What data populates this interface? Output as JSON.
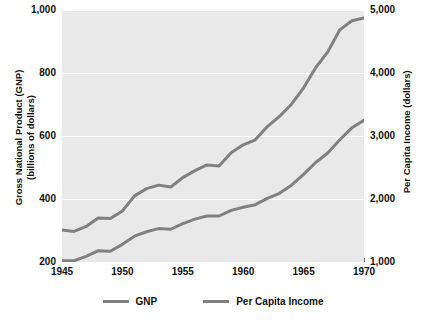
{
  "chart_data": {
    "type": "line",
    "title": "",
    "xlabel": "",
    "ylabel": "Gross National Product (GNP) (billions of dollars)",
    "y2label": "Per Capita Income (dollars)",
    "grid": true,
    "legend_position": "bottom",
    "xlim": [
      1945,
      1970
    ],
    "ylim": [
      200,
      1000
    ],
    "y2lim": [
      1000,
      5000
    ],
    "xticks": [
      "1945",
      "1950",
      "1955",
      "1960",
      "1965",
      "1970"
    ],
    "xtick_values": [
      1945,
      1950,
      1955,
      1960,
      1965,
      1970
    ],
    "yticks": [
      "200",
      "400",
      "600",
      "800",
      "1,000"
    ],
    "ytick_values": [
      200,
      400,
      600,
      800,
      1000
    ],
    "y2ticks": [
      "1,000",
      "2,000",
      "3,000",
      "4,000",
      "5,000"
    ],
    "y2tick_values": [
      1000,
      2000,
      3000,
      4000,
      5000
    ],
    "x": [
      1945,
      1946,
      1947,
      1948,
      1949,
      1950,
      1951,
      1952,
      1953,
      1954,
      1955,
      1956,
      1957,
      1958,
      1959,
      1960,
      1961,
      1962,
      1963,
      1964,
      1965,
      1966,
      1967,
      1968,
      1969,
      1970
    ],
    "series": [
      {
        "name": "GNP",
        "axis": "left",
        "color": "#808080",
        "values": [
          302,
          297,
          313,
          340,
          338,
          362,
          410,
          433,
          444,
          438,
          468,
          490,
          508,
          505,
          547,
          572,
          588,
          630,
          662,
          701,
          753,
          817,
          867,
          937,
          966,
          975
        ]
      },
      {
        "name": "Per Capita Income",
        "axis": "right",
        "color": "#808080",
        "values": [
          1020,
          1020,
          1090,
          1180,
          1170,
          1280,
          1410,
          1480,
          1530,
          1520,
          1610,
          1680,
          1730,
          1730,
          1820,
          1870,
          1910,
          2010,
          2090,
          2220,
          2390,
          2580,
          2730,
          2940,
          3130,
          3250
        ]
      }
    ]
  },
  "legend": {
    "items": [
      {
        "label": "GNP",
        "color": "#808080"
      },
      {
        "label": "Per Capita Income",
        "color": "#808080"
      }
    ]
  }
}
